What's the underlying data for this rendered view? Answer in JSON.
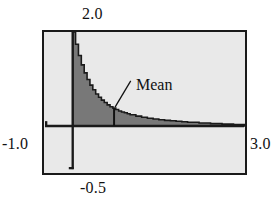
{
  "figure": {
    "background_color": "#ffffff",
    "plot_background_color": "#e9e9e9",
    "frame_color": "#1a1a1a",
    "fill_color": "#787878",
    "curve_color": "#1a1a1a"
  },
  "annotations": {
    "mean_label": "Mean"
  },
  "chart_data": {
    "type": "area",
    "title": "",
    "subtitle": "",
    "xlabel": "",
    "ylabel": "",
    "xlim": [
      -0.5,
      3.0
    ],
    "ylim": [
      -1.0,
      2.0
    ],
    "grid": false,
    "legend": null,
    "axis_tick_labels": {
      "top": "2.0",
      "left": "-1.0",
      "right": "3.0",
      "bottom": "-0.5"
    },
    "mean_x": 0.72,
    "series": [
      {
        "name": "density",
        "x": [
          0.0,
          0.05,
          0.1,
          0.15,
          0.2,
          0.25,
          0.3,
          0.35,
          0.4,
          0.45,
          0.5,
          0.55,
          0.6,
          0.65,
          0.7,
          0.75,
          0.8,
          0.85,
          0.9,
          0.95,
          1.0,
          1.1,
          1.2,
          1.3,
          1.4,
          1.5,
          1.6,
          1.7,
          1.8,
          1.9,
          2.0,
          2.2,
          2.4,
          2.6,
          2.8,
          3.0
        ],
        "values": [
          2.0,
          1.74,
          1.5,
          1.3,
          1.13,
          0.99,
          0.87,
          0.77,
          0.68,
          0.61,
          0.55,
          0.5,
          0.45,
          0.41,
          0.38,
          0.35,
          0.32,
          0.3,
          0.28,
          0.26,
          0.24,
          0.21,
          0.185,
          0.165,
          0.15,
          0.135,
          0.12,
          0.11,
          0.1,
          0.09,
          0.08,
          0.065,
          0.05,
          0.04,
          0.03,
          0.02
        ]
      },
      {
        "name": "dashed-upper-branch",
        "x": [
          -0.28,
          -0.22,
          -0.16,
          -0.1,
          -0.05,
          0.0
        ],
        "values": [
          3.1,
          2.85,
          2.6,
          2.35,
          2.15,
          2.0
        ]
      }
    ]
  }
}
